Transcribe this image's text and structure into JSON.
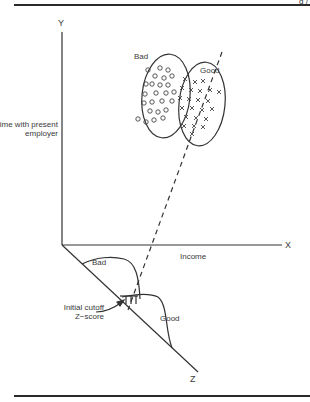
{
  "header": {
    "fragment": "g /"
  },
  "axes": {
    "y": {
      "letter": "Y",
      "label": "Time with present employer"
    },
    "x": {
      "letter": "X",
      "label": "Income"
    },
    "z": {
      "letter": "Z"
    }
  },
  "clusters": {
    "bad": {
      "label": "Bad",
      "marker": "o"
    },
    "good": {
      "label": "Good",
      "marker": "x"
    }
  },
  "distributions": {
    "bad": {
      "label": "Bad"
    },
    "good": {
      "label": "Good"
    },
    "cutoff": {
      "label": "Initial cutoff Z−score"
    }
  },
  "colors": {
    "ink": "#333333",
    "background": "#ffffff"
  }
}
